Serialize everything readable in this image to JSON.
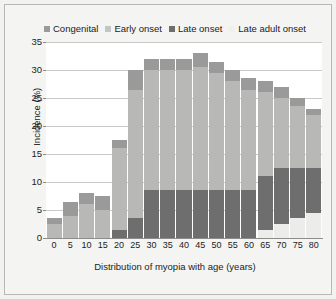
{
  "chart_data": {
    "type": "bar",
    "stacked": true,
    "title": "",
    "xlabel": "Distribution of myopia with age (years)",
    "ylabel": "Incidence (%)",
    "ylim": [
      0,
      35
    ],
    "ytick_values": [
      0,
      5,
      10,
      15,
      20,
      25,
      30,
      35
    ],
    "grid": true,
    "legend_position": "top",
    "categories": [
      "0",
      "5",
      "10",
      "15",
      "20",
      "25",
      "30",
      "35",
      "40",
      "45",
      "50",
      "55",
      "60",
      "65",
      "70",
      "75",
      "80"
    ],
    "series": [
      {
        "name": "Late adult onset",
        "color": "#ececea",
        "values": [
          0,
          0,
          0,
          0,
          0,
          0,
          0,
          0,
          0,
          0,
          0,
          0,
          0,
          1.5,
          2.5,
          3.5,
          4.5
        ]
      },
      {
        "name": "Late onset",
        "color": "#6e6e6e",
        "values": [
          0,
          0,
          0,
          0,
          1.5,
          3.5,
          8.5,
          8.5,
          8.5,
          8.5,
          8.5,
          8.5,
          8.5,
          9.5,
          10.0,
          9.0,
          8.0
        ]
      },
      {
        "name": "Early onset",
        "color": "#b8b8b6",
        "values": [
          2.5,
          4.0,
          6.0,
          5.0,
          14.5,
          23.0,
          21.5,
          21.5,
          21.5,
          22.0,
          21.0,
          19.5,
          18.0,
          15.0,
          12.5,
          11.0,
          9.5
        ]
      },
      {
        "name": "Congenital",
        "color": "#9a9a9a",
        "values": [
          1.0,
          2.5,
          2.0,
          2.5,
          1.5,
          3.5,
          2.0,
          2.0,
          2.0,
          2.5,
          2.0,
          2.0,
          2.0,
          2.0,
          2.0,
          1.5,
          1.0
        ]
      }
    ],
    "totals": [
      3.5,
      6.5,
      8.0,
      7.5,
      17.5,
      30.0,
      32.0,
      32.0,
      32.0,
      33.0,
      31.5,
      30.0,
      28.5,
      28.0,
      27.0,
      25.0,
      23.0
    ]
  },
  "legend": {
    "items": [
      {
        "label": "Congenital",
        "color": "#9a9a9a"
      },
      {
        "label": "Early onset",
        "color": "#c4c4c2"
      },
      {
        "label": "Late onset",
        "color": "#6e6e6e"
      },
      {
        "label": "Late adult onset",
        "color": "#f0f0ee"
      }
    ]
  },
  "axes": {
    "y_label": "Incidence (%)",
    "y_ticks": [
      "35",
      "30",
      "25",
      "20",
      "15",
      "10",
      "5",
      "0"
    ],
    "x_label": "Distribution of myopia with age (years)",
    "x_ticks": [
      "0",
      "5",
      "10",
      "15",
      "20",
      "25",
      "30",
      "35",
      "40",
      "45",
      "50",
      "55",
      "60",
      "65",
      "70",
      "75",
      "80"
    ]
  }
}
